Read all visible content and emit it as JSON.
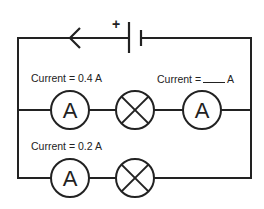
{
  "diagram": {
    "type": "circuit",
    "battery": {
      "polarity_label": "+"
    },
    "current_direction": "left",
    "branches": [
      {
        "name": "upper-branch",
        "components": [
          "ammeter",
          "lamp",
          "ammeter"
        ],
        "labels": [
          {
            "text": "Current = 0.4 A"
          },
          {
            "prefix": "Current =",
            "blank": true,
            "suffix": "A"
          }
        ]
      },
      {
        "name": "lower-branch",
        "components": [
          "ammeter",
          "lamp"
        ],
        "labels": [
          {
            "text": "Current = 0.2 A"
          }
        ]
      }
    ],
    "ammeter_symbol": "A",
    "colors": {
      "wire": "#222222",
      "background": "#ffffff"
    }
  }
}
